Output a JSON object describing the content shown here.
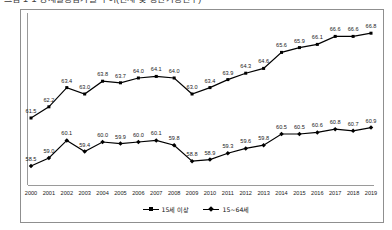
{
  "title": {
    "text": "그림 1-1  경제활동참가율 추이(전체 및 생산가능인구)",
    "visible_note": "cropped at top edge"
  },
  "legend": {
    "position": "bottom-center",
    "items": [
      {
        "label": "15세 이상",
        "marker": "square",
        "color": "#000000"
      },
      {
        "label": "15~64세",
        "marker": "diamond",
        "color": "#000000"
      }
    ]
  },
  "axes": {
    "x_years": [
      "2000",
      "2001",
      "2002",
      "2003",
      "2004",
      "2005",
      "2006",
      "2007",
      "2008",
      "2009",
      "2010",
      "2011",
      "2012",
      "2013",
      "2014",
      "2015",
      "2016",
      "2017",
      "2018",
      "2019"
    ],
    "grid": false,
    "y_axis_visible_line": true,
    "y_tick_labels": []
  },
  "chart_data": {
    "type": "line",
    "title": "그림 1-1  경제활동참가율 추이(전체 및 생산가능인구)",
    "xlabel": "",
    "ylabel": "",
    "ylim": [
      57.5,
      67.5
    ],
    "grid": false,
    "legend_position": "bottom-center",
    "categories": [
      "2000",
      "2001",
      "2002",
      "2003",
      "2004",
      "2005",
      "2006",
      "2007",
      "2008",
      "2009",
      "2010",
      "2011",
      "2012",
      "2013",
      "2014",
      "2015",
      "2016",
      "2017",
      "2018",
      "2019"
    ],
    "series": [
      {
        "name": "15세 이상",
        "color": "#000000",
        "marker": "square",
        "values": [
          61.5,
          62.2,
          63.4,
          63.0,
          63.8,
          63.7,
          64.0,
          64.1,
          64.0,
          63.0,
          63.4,
          63.9,
          64.3,
          64.6,
          65.6,
          65.9,
          66.1,
          66.6,
          66.6,
          66.8
        ]
      },
      {
        "name": "15~64세",
        "color": "#000000",
        "marker": "diamond",
        "values": [
          58.5,
          59.0,
          60.1,
          59.4,
          60.0,
          59.9,
          60.0,
          60.1,
          59.8,
          58.8,
          58.9,
          59.3,
          59.6,
          59.8,
          60.5,
          60.5,
          60.6,
          60.8,
          60.7,
          60.9
        ]
      }
    ]
  }
}
